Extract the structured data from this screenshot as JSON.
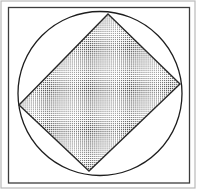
{
  "figure": {
    "background_color": "#ffffff",
    "canvas": {
      "width": 198,
      "height": 191
    },
    "outer_edge": {
      "name": "outer-image-edge",
      "x": 1.0,
      "y": 1.0,
      "width": 194.0,
      "height": 187.0,
      "stroke_color": "#b9b9b9",
      "stroke_width": 1.2,
      "fill": "none"
    },
    "frame": {
      "name": "figure-frame",
      "x": 8.5,
      "y": 7.5,
      "width": 181.0,
      "height": 175.5,
      "stroke_color": "#3c3c3c",
      "stroke_width": 1.3,
      "fill": "#ffffff"
    },
    "circle": {
      "name": "circumscribed-circle",
      "cx": 100.0,
      "cy": 93.5,
      "r": 82.0,
      "stroke_color": "#1e1e1e",
      "stroke_width": 1.3,
      "fill": "none"
    },
    "square": {
      "name": "inscribed-square",
      "rotation_degrees": 39,
      "vertices": [
        {
          "label": "top",
          "x": 108.0,
          "y": 14.0
        },
        {
          "label": "right",
          "x": 180.0,
          "y": 84.0
        },
        {
          "label": "bottom",
          "x": 89.0,
          "y": 171.0
        },
        {
          "label": "left",
          "x": 19.0,
          "y": 105.0
        }
      ],
      "points": "108,14 180,84 89,171 19,105",
      "stroke_color": "#2a2a2a",
      "stroke_width": 1.4,
      "fill_pattern": "stipple-dot-grid",
      "fill_base_color": "#ffffff",
      "fill_dot_color": "#4a4a4a",
      "fill_dot_spacing": 2.05,
      "fill_dot_size": 1.0
    }
  }
}
